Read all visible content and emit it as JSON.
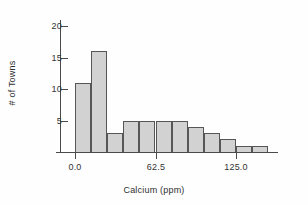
{
  "chart_data": {
    "type": "bar",
    "title": "",
    "subtitle": "",
    "xlabel": "Calcium (ppm)",
    "ylabel": "# of Towns",
    "grid": false,
    "legend": false,
    "xlim": [
      -12.5,
      175.0
    ],
    "ylim": [
      0,
      21
    ],
    "bin_width": 12.5,
    "xticks": [
      0.0,
      62.5,
      125.0
    ],
    "xtick_labels": [
      "0.0",
      "62.5",
      "125.0"
    ],
    "yticks": [
      5,
      10,
      15,
      20
    ],
    "ytick_labels": [
      "5",
      "10",
      "15",
      "20"
    ],
    "categories": [
      "0.0-12.5",
      "12.5-25.0",
      "25.0-37.5",
      "37.5-50.0",
      "50.0-62.5",
      "62.5-75.0",
      "75.0-87.5",
      "87.5-100.0",
      "100.0-112.5",
      "112.5-125.0",
      "125.0-137.5",
      "137.5-150.0"
    ],
    "bin_starts": [
      0.0,
      12.5,
      25.0,
      37.5,
      50.0,
      62.5,
      75.0,
      87.5,
      100.0,
      112.5,
      125.0,
      137.5
    ],
    "values": [
      11,
      16,
      3,
      5,
      5,
      5,
      5,
      4,
      3,
      2,
      1,
      1
    ],
    "bar_fill_color": "#d2d2d2",
    "bar_edge_color": "#565656",
    "axis_color": "#4a4a4a",
    "background_color": "#ffffff",
    "total_towns": 61
  },
  "axes": {
    "x_title": "Calcium (ppm)",
    "y_title": "# of Towns"
  }
}
